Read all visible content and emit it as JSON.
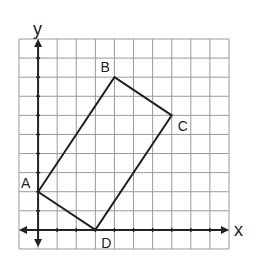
{
  "diagram": {
    "type": "coordinate-grid-quadrilateral",
    "grid": {
      "columns": 11,
      "rows": 11,
      "cell_px": 19.09,
      "origin_cell_offset": {
        "x": 1,
        "y": 1
      },
      "line_color": "#9a9a9a",
      "axis_color": "#222222"
    },
    "axes": {
      "x_label": "x",
      "y_label": "y"
    },
    "points": [
      {
        "label": "A",
        "x": 0,
        "y": 2
      },
      {
        "label": "B",
        "x": 4,
        "y": 8
      },
      {
        "label": "C",
        "x": 7,
        "y": 6
      },
      {
        "label": "D",
        "x": 3,
        "y": 0
      }
    ],
    "polygon": [
      "A",
      "B",
      "C",
      "D"
    ],
    "shape_color": "#222222"
  }
}
